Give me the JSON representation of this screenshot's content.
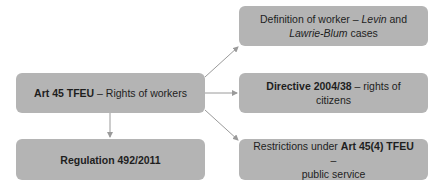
{
  "diagram": {
    "type": "flowchart",
    "colors": {
      "box_fill": "#b4b4b4",
      "arrow": "#9a9a9a",
      "text": "#1e1e1e"
    },
    "nodes": {
      "root": {
        "bold": "Art 45 TFEU",
        "rest": " – Rights of workers"
      },
      "regulation": {
        "bold": "Regulation 492/2011"
      },
      "definition": {
        "line1_pre": "Definition of worker – ",
        "line1_italic": "Levin",
        "line1_post": " and",
        "line2_italic": "Lawrie-Blum",
        "line2_post": " cases"
      },
      "directive": {
        "bold": "Directive 2004/38",
        "rest": " – rights of citizens"
      },
      "restrictions": {
        "pre": "Restrictions under ",
        "bold": "Art 45(4) TFEU",
        "post": " –",
        "line2": "public service"
      }
    },
    "edges": [
      {
        "from": "root",
        "to": "regulation"
      },
      {
        "from": "root",
        "to": "definition"
      },
      {
        "from": "root",
        "to": "directive"
      },
      {
        "from": "root",
        "to": "restrictions"
      }
    ]
  }
}
